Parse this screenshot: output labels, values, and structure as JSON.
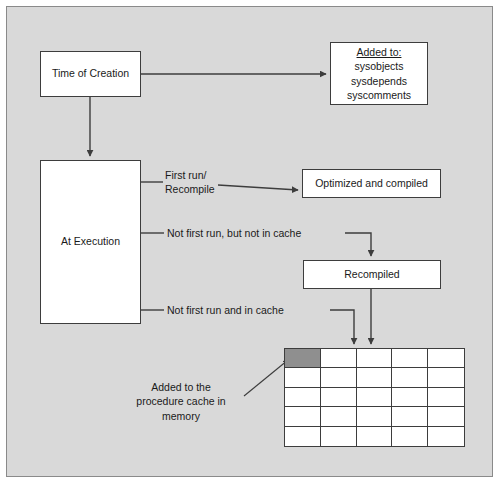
{
  "diagram": {
    "frame": {
      "background_color": "#d9d9d9",
      "border_color": "#8a8a8a"
    },
    "nodes": {
      "time_of_creation": {
        "label": "Time of Creation"
      },
      "at_execution": {
        "label": "At Execution"
      },
      "added_to": {
        "header": "Added to:",
        "line1": "sysobjects",
        "line2": "sysdepends",
        "line3": "syscomments"
      },
      "optimized": {
        "label": "Optimized and compiled"
      },
      "recompiled": {
        "label": "Recompiled"
      }
    },
    "edge_labels": {
      "first_run": "First run/\nRecompile",
      "not_first_not_cache": "Not first run, but not in cache",
      "not_first_in_cache": "Not first run and in cache",
      "added_to_cache": "Added to the\nprocedure cache in\nmemory"
    },
    "grid": {
      "name": "procedure-cache-grid",
      "columns": 5,
      "rows": 5,
      "filled_cell": {
        "row": 1,
        "column": 1,
        "color": "#8f8f8f"
      },
      "empty_cell_color": "#ffffff",
      "border_color": "#3d3d3d"
    },
    "colors": {
      "box_fill": "#ffffff",
      "box_border": "#3d3d3d",
      "text": "#1a1a1a",
      "connector": "#3d3d3d"
    }
  }
}
